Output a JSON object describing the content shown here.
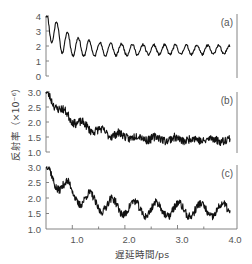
{
  "chart_data": [
    {
      "panel": "(a)",
      "type": "line",
      "title": "",
      "xlabel": "遅延時間/ps",
      "ylabel": "反射率（×10⁻⁶）",
      "xlim": [
        0.5,
        4.0
      ],
      "ylim": [
        0,
        4
      ],
      "yticks": [
        "0",
        "1",
        "2",
        "3",
        "4"
      ],
      "grid": false,
      "description": "Strongly oscillating damped signal, period ~0.2 ps, decaying from ~4 to oscillation about ~1.7",
      "x": [
        0.5,
        0.6,
        0.7,
        0.8,
        0.9,
        1.0,
        1.1,
        1.2,
        1.3,
        1.5,
        1.7,
        2.0,
        2.5,
        3.0,
        3.5,
        4.0
      ],
      "values": [
        3.9,
        3.1,
        1.9,
        3.4,
        1.0,
        3.3,
        1.0,
        2.6,
        1.5,
        2.0,
        1.6,
        2.2,
        1.9,
        1.6,
        1.9,
        1.7
      ],
      "model": {
        "start": 3.9,
        "baseline": 1.75,
        "decay_tau": 0.25,
        "osc_amp": 1.2,
        "osc_decay": 0.6,
        "osc_floor": 0.3,
        "period": 0.205,
        "noise": 0.08,
        "seed": 11
      }
    },
    {
      "panel": "(b)",
      "type": "line",
      "title": "",
      "xlabel": "遅延時間/ps",
      "ylabel": "反射率（×10⁻⁶）",
      "xlim": [
        0.5,
        4.0
      ],
      "ylim": [
        1.0,
        3.0
      ],
      "yticks": [
        "1.0",
        "1.5",
        "2.0",
        "2.5",
        "3.0"
      ],
      "grid": false,
      "description": "Noisy decaying signal from ~3.0 to ~1.4 with weak oscillation",
      "x": [
        0.5,
        0.6,
        0.8,
        1.0,
        1.2,
        1.5,
        2.0,
        2.5,
        3.0,
        3.5,
        4.0
      ],
      "values": [
        3.0,
        2.3,
        2.5,
        1.8,
        2.0,
        1.6,
        1.5,
        1.4,
        1.4,
        1.35,
        1.4
      ],
      "model": {
        "start": 3.0,
        "baseline": 1.4,
        "decay_tau": 0.6,
        "osc_amp": 0.12,
        "osc_decay": 1.5,
        "osc_floor": 0.05,
        "period": 0.35,
        "noise": 0.14,
        "seed": 23
      }
    },
    {
      "panel": "(c)",
      "type": "line",
      "title": "",
      "xlabel": "遅延時間/ps",
      "ylabel": "反射率（×10⁻⁶）",
      "xlim": [
        0.5,
        4.0
      ],
      "ylim": [
        1.0,
        3.0
      ],
      "yticks": [
        "1.0",
        "1.5",
        "2.0",
        "2.5",
        "3.0"
      ],
      "xticks": [
        "1.0",
        "2.0",
        "3.0",
        "4.0"
      ],
      "grid": false,
      "description": "Noisy decaying signal with clear oscillations, period ~0.4 ps, from ~3.0 to ~1.6",
      "x": [
        0.5,
        0.6,
        0.8,
        1.0,
        1.2,
        1.5,
        2.0,
        2.5,
        3.0,
        3.5,
        4.0
      ],
      "values": [
        3.0,
        2.3,
        2.5,
        1.7,
        2.2,
        1.8,
        1.5,
        1.9,
        1.6,
        1.5,
        1.7
      ],
      "model": {
        "start": 3.0,
        "baseline": 1.6,
        "decay_tau": 0.55,
        "osc_amp": 0.28,
        "osc_decay": 3.0,
        "osc_floor": 0.18,
        "period": 0.42,
        "noise": 0.13,
        "seed": 37
      }
    }
  ],
  "labels": {
    "panel_a": "(a)",
    "panel_b": "(b)",
    "panel_c": "(c)",
    "ylabel": "反射率（×10⁻⁶）",
    "xlabel": "遅延時間/ps",
    "xticks": [
      "1.0",
      "2.0",
      "3.0",
      "4.0"
    ],
    "yticks_a": [
      "0",
      "1",
      "2",
      "3",
      "4"
    ],
    "yticks_b": [
      "1.0",
      "1.5",
      "2.0",
      "2.5",
      "3.0"
    ],
    "yticks_c": [
      "1.0",
      "1.5",
      "2.0",
      "2.5",
      "3.0"
    ]
  }
}
